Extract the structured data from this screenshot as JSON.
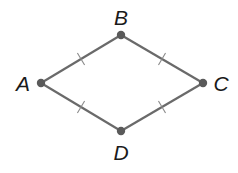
{
  "diagram": {
    "type": "rhombus",
    "colors": {
      "edge": "#6a6a6a",
      "vertex": "#5a5a5a",
      "tick": "#8a8a8a",
      "label": "#1a1a1a"
    },
    "vertices": [
      {
        "name": "A",
        "x": 41,
        "y": 83,
        "label_x": 23,
        "label_y": 91
      },
      {
        "name": "B",
        "x": 121,
        "y": 35,
        "label_x": 121,
        "label_y": 25
      },
      {
        "name": "C",
        "x": 203,
        "y": 83,
        "label_x": 221,
        "label_y": 91
      },
      {
        "name": "D",
        "x": 121,
        "y": 131,
        "label_x": 121,
        "label_y": 160
      }
    ],
    "edges": [
      {
        "from": "A",
        "to": "B",
        "ticks": 1
      },
      {
        "from": "B",
        "to": "C",
        "ticks": 1
      },
      {
        "from": "C",
        "to": "D",
        "ticks": 1
      },
      {
        "from": "D",
        "to": "A",
        "ticks": 1
      }
    ]
  }
}
